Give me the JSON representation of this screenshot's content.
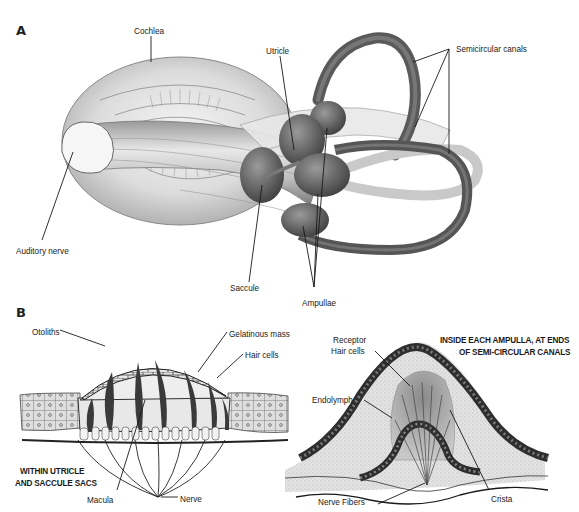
{
  "figure": {
    "panel_a": {
      "letter": "A",
      "labels": {
        "cochlea": "Cochlea",
        "utricle": "Utricle",
        "semicircular_canals": "Semicircular canals",
        "auditory_nerve": "Auditory nerve",
        "saccule": "Saccule",
        "ampullae": "Ampullae"
      }
    },
    "panel_b": {
      "letter": "B",
      "left": {
        "labels": {
          "otoliths": "Otoliths",
          "gelatinous_mass": "Gelatinous mass",
          "hair_cells": "Hair cells",
          "macula": "Macula",
          "nerve": "Nerve"
        },
        "caption_line1": "WITHIN UTRICLE",
        "caption_line2": "AND SACCULE SACS"
      },
      "right": {
        "labels": {
          "receptor_line1": "Receptor",
          "receptor_line2": "Hair cells",
          "endolymph": "Endolymph",
          "crista": "Crista",
          "nerve_fibers": "Nerve Fibers"
        },
        "caption_line1": "INSIDE EACH AMPULLA, AT ENDS",
        "caption_line2": "OF SEMI-CIRCULAR CANALS"
      }
    },
    "colors": {
      "ink": "#1a1a1a",
      "tissue_dark": "#4a4a4a",
      "tissue_mid": "#8a8a8a",
      "tissue_light": "#d4d4d4",
      "background": "#ffffff"
    }
  }
}
